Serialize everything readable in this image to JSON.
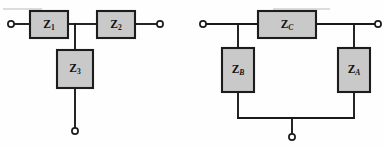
{
  "figure": {
    "background_color": "#fefefe",
    "wire_color": "#1a1a1a",
    "box_fill_color": "#c9c9c9",
    "box_stroke_color": "#1c1c1c",
    "terminal_fill_color": "#ffffff",
    "label_color": "#111111"
  },
  "networks": [
    {
      "id": "t-network",
      "name": "T network",
      "components": [
        {
          "id": "z1",
          "base": "Z",
          "subscript": "1",
          "subscript_style": "upright",
          "orientation": "horizontal",
          "x": 30,
          "y": 11,
          "w": 38,
          "h": 27,
          "label_cx": 49,
          "label_cy": 25
        },
        {
          "id": "z2",
          "base": "Z",
          "subscript": "2",
          "subscript_style": "upright",
          "orientation": "horizontal",
          "x": 97,
          "y": 11,
          "w": 38,
          "h": 27,
          "label_cx": 116,
          "label_cy": 25
        },
        {
          "id": "z3",
          "base": "Z",
          "subscript": "3",
          "subscript_style": "upright",
          "orientation": "vertical",
          "x": 57,
          "y": 50,
          "w": 36,
          "h": 38,
          "label_cx": 75,
          "label_cy": 69
        }
      ],
      "terminals": [
        {
          "id": "t-left-terminal",
          "cx": 11,
          "cy": 24,
          "r": 3.1
        },
        {
          "id": "t-right-terminal",
          "cx": 160,
          "cy": 24,
          "r": 3.1
        },
        {
          "id": "t-bottom-terminal",
          "cx": 75,
          "cy": 131,
          "r": 3.1
        }
      ],
      "wires": [
        {
          "id": "t-wire-left-in",
          "d": "M 14.1 24 L 30 24"
        },
        {
          "id": "t-wire-mid-top",
          "d": "M 68 24 L 97 24"
        },
        {
          "id": "t-wire-right-out",
          "d": "M 135 24 L 156.9 24"
        },
        {
          "id": "t-wire-shunt-upper",
          "d": "M 75 24 L 75 50"
        },
        {
          "id": "t-wire-shunt-lower",
          "d": "M 75 88 L 75 127.9"
        }
      ]
    },
    {
      "id": "pi-network",
      "name": "Pi network",
      "components": [
        {
          "id": "zc",
          "base": "Z",
          "subscript": "C",
          "subscript_style": "italic",
          "orientation": "horizontal",
          "x": 258,
          "y": 11,
          "w": 58,
          "h": 27,
          "label_cx": 287,
          "label_cy": 25
        },
        {
          "id": "zb",
          "base": "Z",
          "subscript": "B",
          "subscript_style": "italic",
          "orientation": "vertical",
          "x": 222,
          "y": 48,
          "w": 32,
          "h": 44,
          "label_cx": 238,
          "label_cy": 70
        },
        {
          "id": "za",
          "base": "Z",
          "subscript": "A",
          "subscript_style": "italic",
          "orientation": "vertical",
          "x": 338,
          "y": 48,
          "w": 32,
          "h": 44,
          "label_cx": 354,
          "label_cy": 70
        }
      ],
      "terminals": [
        {
          "id": "pi-left-terminal",
          "cx": 203,
          "cy": 24,
          "r": 3.1
        },
        {
          "id": "pi-right-terminal",
          "cx": 378,
          "cy": 24,
          "r": 3.1
        },
        {
          "id": "pi-bottom-terminal",
          "cx": 292,
          "cy": 137,
          "r": 3.1
        }
      ],
      "wires": [
        {
          "id": "pi-wire-left-in",
          "d": "M 206.1 24 L 258 24"
        },
        {
          "id": "pi-wire-right-out",
          "d": "M 316 24 L 374.9 24"
        },
        {
          "id": "pi-wire-zb-top",
          "d": "M 238 24 L 238 48"
        },
        {
          "id": "pi-wire-za-top",
          "d": "M 354 24 L 354 48"
        },
        {
          "id": "pi-wire-zb-bottom",
          "d": "M 238 92 L 238 118"
        },
        {
          "id": "pi-wire-za-bottom",
          "d": "M 354 92 L 354 118"
        },
        {
          "id": "pi-wire-ground-bus",
          "d": "M 238 118 L 354 118"
        },
        {
          "id": "pi-wire-ground-drop",
          "d": "M 292 118 L 292 133.9"
        }
      ]
    }
  ],
  "artifacts": [
    {
      "id": "top-edge-artifact-left",
      "d": "M 3 9 L 42 9"
    },
    {
      "id": "top-edge-artifact-right",
      "d": "M 273 9 L 330 9"
    }
  ]
}
